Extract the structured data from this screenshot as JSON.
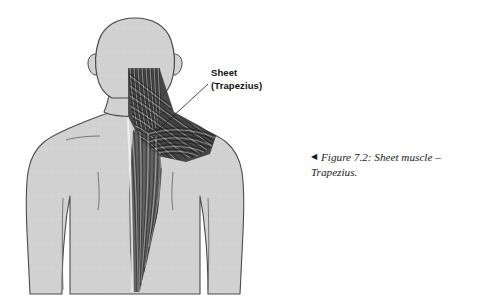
{
  "figure": {
    "callout": {
      "line1": "Sheet",
      "line2": "(Trapezius)"
    },
    "caption": {
      "marker": "◀",
      "text": "Figure 7.2: Sheet muscle – Trapezius."
    },
    "colors": {
      "background": "#ffffff",
      "body_fill": "#d2d2d2",
      "outline": "#4a4a4a",
      "muscle_dark": "#2a2a2a",
      "muscle_light": "#f2f2f2",
      "text": "#111111"
    },
    "highlighted_muscle": "Trapezius"
  }
}
